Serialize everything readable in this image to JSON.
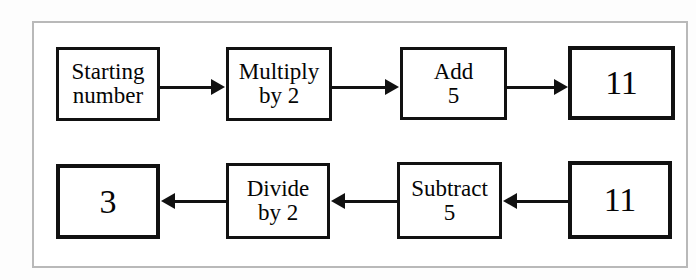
{
  "diagram": {
    "colors": {
      "node_border": "#111111",
      "node_fill": "#ffffff",
      "frame_border": "#b9b9b9",
      "arrow": "#111111",
      "text": "#050505"
    },
    "rows": [
      {
        "name": "forward-row",
        "direction": "right",
        "nodes": [
          {
            "id": "starting-number",
            "kind": "label",
            "lines": [
              "Starting",
              "number"
            ]
          },
          {
            "id": "multiply-by-2",
            "kind": "label",
            "lines": [
              "Multiply",
              "by 2"
            ]
          },
          {
            "id": "add-5",
            "kind": "label",
            "lines": [
              "Add",
              "5"
            ]
          },
          {
            "id": "result-11-top",
            "kind": "value",
            "lines": [
              "11"
            ]
          }
        ]
      },
      {
        "name": "inverse-row",
        "direction": "left",
        "nodes": [
          {
            "id": "result-3",
            "kind": "value",
            "lines": [
              "3"
            ]
          },
          {
            "id": "divide-by-2",
            "kind": "label",
            "lines": [
              "Divide",
              "by 2"
            ]
          },
          {
            "id": "subtract-5",
            "kind": "label",
            "lines": [
              "Subtract",
              "5"
            ]
          },
          {
            "id": "input-11-bottom",
            "kind": "value",
            "lines": [
              "11"
            ]
          }
        ]
      }
    ]
  }
}
